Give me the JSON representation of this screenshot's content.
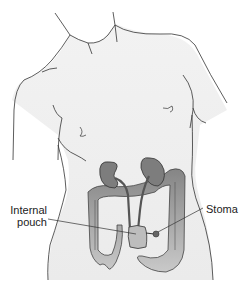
{
  "figure": {
    "labels": {
      "internal_pouch_line1": "Internal",
      "internal_pouch_line2": "pouch",
      "stoma": "Stoma"
    },
    "colors": {
      "skin": "#eeeeee",
      "outline": "#333333",
      "organ_dark": "#7a7a7a",
      "organ_mid": "#9a9a9a",
      "organ_light": "#c8c8c8"
    }
  }
}
